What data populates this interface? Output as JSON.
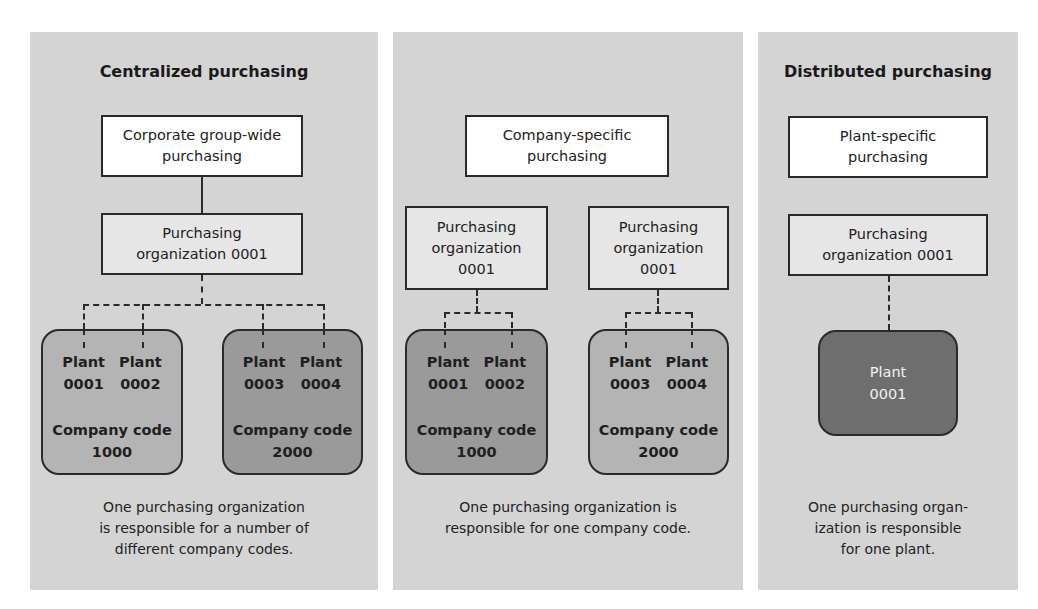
{
  "colors": {
    "panel_bg": "#d4d4d4",
    "top_box": "#ffffff",
    "purch_org_box": "#e6e6e6",
    "company_code_light": "#b4b4b4",
    "company_code_dark": "#9a9a9a",
    "plant_dark": "#6e6e6e"
  },
  "panels": [
    {
      "title": "Centralized purchasing",
      "top_box": [
        "Corporate group-wide",
        "purchasing"
      ],
      "purch_orgs": [
        {
          "lines": [
            "Purchasing",
            "organization 0001"
          ]
        }
      ],
      "company_codes": [
        {
          "plants": [
            [
              "Plant",
              "0001"
            ],
            [
              "Plant",
              "0002"
            ]
          ],
          "label": [
            "Company code",
            "1000"
          ]
        },
        {
          "plants": [
            [
              "Plant",
              "0003"
            ],
            [
              "Plant",
              "0004"
            ]
          ],
          "label": [
            "Company code",
            "2000"
          ]
        }
      ],
      "caption": [
        "One purchasing organization",
        "is responsible for a number of",
        "different company codes."
      ]
    },
    {
      "title": "",
      "top_box": [
        "Company-specific",
        "purchasing"
      ],
      "purch_orgs": [
        {
          "lines": [
            "Purchasing",
            "organization",
            "0001"
          ]
        },
        {
          "lines": [
            "Purchasing",
            "organization",
            "0001"
          ]
        }
      ],
      "company_codes": [
        {
          "plants": [
            [
              "Plant",
              "0001"
            ],
            [
              "Plant",
              "0002"
            ]
          ],
          "label": [
            "Company code",
            "1000"
          ]
        },
        {
          "plants": [
            [
              "Plant",
              "0003"
            ],
            [
              "Plant",
              "0004"
            ]
          ],
          "label": [
            "Company code",
            "2000"
          ]
        }
      ],
      "caption": [
        "One purchasing organization is",
        "responsible for one company code."
      ]
    },
    {
      "title": "Distributed purchasing",
      "top_box": [
        "Plant-specific",
        "purchasing"
      ],
      "purch_orgs": [
        {
          "lines": [
            "Purchasing",
            "organization 0001"
          ]
        }
      ],
      "plant": [
        "Plant",
        "0001"
      ],
      "caption": [
        "One purchasing organ-",
        "ization is responsible",
        "for one plant."
      ]
    }
  ]
}
